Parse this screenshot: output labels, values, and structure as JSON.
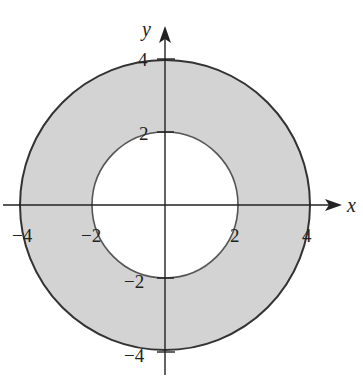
{
  "figure": {
    "colors": {
      "background": "#ffffff",
      "fill": "#d3d3d3",
      "outer_stroke": "#333333",
      "inner_stroke": "#555555",
      "axis": "#222222"
    },
    "axes": {
      "x_label": "x",
      "y_label": "y"
    },
    "regions": {
      "outer_radius": 4,
      "inner_radius": 2
    },
    "ticks": {
      "x": [
        {
          "value": -4,
          "label": "−4"
        },
        {
          "value": -2,
          "label": "−2"
        },
        {
          "value": 2,
          "label": "2"
        },
        {
          "value": 4,
          "label": "4"
        }
      ],
      "y": [
        {
          "value": 4,
          "label": "4"
        },
        {
          "value": 2,
          "label": "2"
        },
        {
          "value": -2,
          "label": "−2"
        },
        {
          "value": -4,
          "label": "−4"
        }
      ]
    }
  }
}
